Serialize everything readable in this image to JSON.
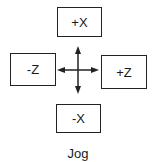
{
  "jog": {
    "buttons": {
      "plus_x": "+X",
      "minus_z": "-Z",
      "plus_z": "+Z",
      "minus_x": "-X"
    },
    "caption": "Jog",
    "center_icon": "four-way-arrow-icon"
  }
}
